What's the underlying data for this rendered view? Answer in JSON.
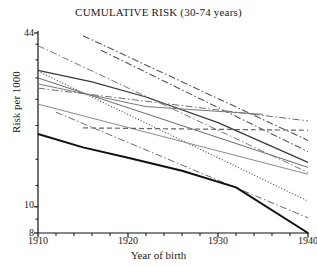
{
  "chart_data": {
    "type": "line",
    "title": "CUMULATIVE RISK (30-74 years)",
    "xlabel": "Year of birth",
    "ylabel": "Risk per 1000",
    "xlim": [
      1910,
      1940
    ],
    "ylim": [
      8,
      44
    ],
    "yscale": "log",
    "grid": false,
    "legend": "none",
    "xticks": [
      1910,
      1920,
      1930,
      1940
    ],
    "xminor_step": 2,
    "yticks": [
      44,
      10,
      8
    ],
    "yminor": [
      40,
      35,
      30,
      25,
      20,
      15,
      12,
      9
    ],
    "x_tick_labels": [
      "1910",
      "1920",
      "1930",
      "1940"
    ],
    "y_tick_labels": [
      "44",
      "10",
      "8"
    ],
    "series": [
      {
        "name": "series-1",
        "style": "dashdot",
        "color": "#555555",
        "width": 1.1,
        "x": [
          1915,
          1940
        ],
        "y": [
          43.0,
          17.6
        ]
      },
      {
        "name": "series-2",
        "style": "dashdot",
        "color": "#555555",
        "width": 1.1,
        "x": [
          1917,
          1940
        ],
        "y": [
          38.0,
          16.0
        ]
      },
      {
        "name": "series-3",
        "style": "dashdot",
        "color": "#777777",
        "width": 1.0,
        "x": [
          1910,
          1940
        ],
        "y": [
          39.5,
          13.4
        ]
      },
      {
        "name": "series-4",
        "style": "solid",
        "color": "#3a3a3a",
        "width": 1.2,
        "x": [
          1910,
          1916,
          1922,
          1930,
          1940
        ],
        "y": [
          32.0,
          29.0,
          25.5,
          20.5,
          14.6
        ]
      },
      {
        "name": "series-5",
        "style": "dotted",
        "color": "#444444",
        "width": 1.1,
        "x": [
          1910,
          1940
        ],
        "y": [
          31.8,
          10.5
        ]
      },
      {
        "name": "series-6",
        "style": "solid",
        "color": "#6a6a6a",
        "width": 1.0,
        "x": [
          1910,
          1940
        ],
        "y": [
          30.0,
          14.0
        ]
      },
      {
        "name": "series-7",
        "style": "solid",
        "color": "#7a7a7a",
        "width": 1.0,
        "x": [
          1910,
          1922,
          1935
        ],
        "y": [
          28.5,
          23.5,
          22.0
        ]
      },
      {
        "name": "series-8",
        "style": "dashdot",
        "color": "#6f6f6f",
        "width": 1.0,
        "x": [
          1910,
          1940
        ],
        "y": [
          27.5,
          20.8
        ]
      },
      {
        "name": "series-9",
        "style": "solid",
        "color": "#8a8a8a",
        "width": 1.0,
        "x": [
          1910,
          1940
        ],
        "y": [
          24.0,
          13.2
        ]
      },
      {
        "name": "series-10",
        "style": "dashdot",
        "color": "#6a6a6a",
        "width": 1.0,
        "x": [
          1912,
          1940
        ],
        "y": [
          22.4,
          9.1
        ]
      },
      {
        "name": "series-11",
        "style": "dashed",
        "color": "#666666",
        "width": 1.2,
        "x": [
          1915,
          1940
        ],
        "y": [
          19.6,
          19.2
        ]
      },
      {
        "name": "series-12",
        "style": "solid",
        "color": "#111111",
        "width": 2.0,
        "x": [
          1910,
          1915,
          1920,
          1926,
          1932,
          1940
        ],
        "y": [
          18.6,
          16.6,
          15.2,
          13.6,
          11.8,
          8.0
        ]
      }
    ]
  }
}
